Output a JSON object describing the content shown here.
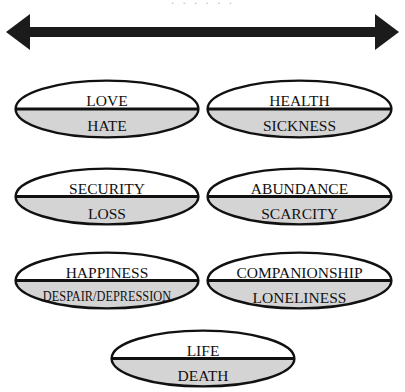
{
  "figure": {
    "caption_remnant": "· · ·   · ·   ·",
    "arrow": {
      "name": "double-headed-horizontal-arrow",
      "direction": "bidirectional",
      "color": "#1b1b1b"
    },
    "colors": {
      "outline": "#111111",
      "positive_fill": "#ffffff",
      "negative_fill": "#d4d4d4",
      "text": "#111111",
      "arrow": "#1b1b1b"
    },
    "ovals": [
      {
        "id": "love-hate",
        "positive": "LOVE",
        "negative": "HATE",
        "x": 14,
        "y": 79,
        "w": 186,
        "h": 60,
        "condensed": false
      },
      {
        "id": "health-sickness",
        "positive": "HEALTH",
        "negative": "SICKNESS",
        "x": 206,
        "y": 79,
        "w": 187,
        "h": 60,
        "condensed": false
      },
      {
        "id": "security-loss",
        "positive": "SECURITY",
        "negative": "LOSS",
        "x": 14,
        "y": 167,
        "w": 186,
        "h": 59,
        "condensed": false
      },
      {
        "id": "abundance-scarcity",
        "positive": "ABUNDANCE",
        "negative": "SCARCITY",
        "x": 206,
        "y": 167,
        "w": 187,
        "h": 59,
        "condensed": false
      },
      {
        "id": "happiness-despair",
        "positive": "HAPPINESS",
        "negative": "DESPAIR/DEPRESSION",
        "x": 14,
        "y": 251,
        "w": 186,
        "h": 59,
        "condensed": true
      },
      {
        "id": "companionship-loneliness",
        "positive": "COMPANIONSHIP",
        "negative": "LONELINESS",
        "x": 206,
        "y": 251,
        "w": 187,
        "h": 59,
        "condensed": false
      },
      {
        "id": "life-death",
        "positive": "LIFE",
        "negative": "DEATH",
        "x": 110,
        "y": 329,
        "w": 186,
        "h": 59,
        "condensed": false
      }
    ]
  }
}
